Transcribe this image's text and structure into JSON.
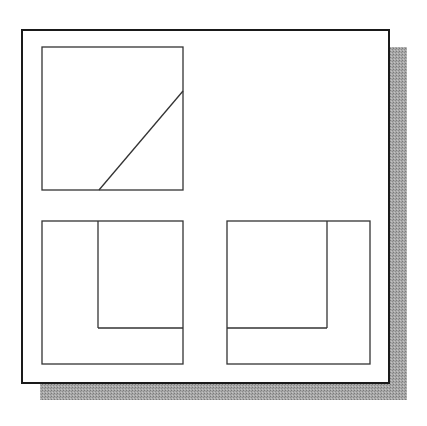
{
  "diagram": {
    "type": "orthographic-projection",
    "colors": {
      "background": "#ffffff",
      "frame_stroke": "#1a1a1a",
      "line_stroke": "#333333",
      "shadow": "#9a9a9a"
    },
    "frame": {
      "x": 22,
      "y": 30,
      "width": 367,
      "height": 353,
      "stroke_width": 2
    },
    "shadow": {
      "offset_x": 18,
      "offset_y": 17
    },
    "views": [
      {
        "name": "top-view",
        "rect": {
          "x": 42,
          "y": 47,
          "width": 141,
          "height": 143
        },
        "lines": [
          {
            "x1": 99,
            "y1": 190,
            "x2": 183,
            "y2": 91
          }
        ]
      },
      {
        "name": "front-view",
        "rect": {
          "x": 42,
          "y": 221,
          "width": 141,
          "height": 143
        },
        "lines": [
          {
            "x1": 98,
            "y1": 221,
            "x2": 98,
            "y2": 328
          },
          {
            "x1": 98,
            "y1": 328,
            "x2": 183,
            "y2": 328
          }
        ]
      },
      {
        "name": "side-view",
        "rect": {
          "x": 227,
          "y": 221,
          "width": 143,
          "height": 143
        },
        "lines": [
          {
            "x1": 327,
            "y1": 221,
            "x2": 327,
            "y2": 328
          },
          {
            "x1": 227,
            "y1": 328,
            "x2": 327,
            "y2": 328
          }
        ]
      }
    ]
  }
}
